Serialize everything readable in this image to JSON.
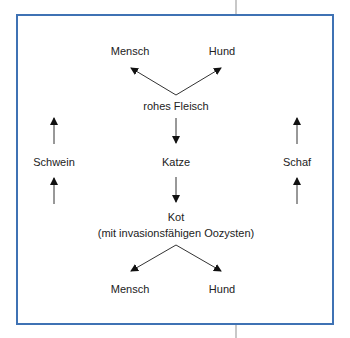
{
  "diagram": {
    "border_color": "#3f72b4",
    "top_row": {
      "left": "Mensch",
      "right": "Hund"
    },
    "source_meat": "rohes Fleisch",
    "middle_row": {
      "left": "Schwein",
      "center": "Katze",
      "right": "Schaf"
    },
    "feces": {
      "line1": "Kot",
      "line2": "(mit invasionsfähigen Oozysten)"
    },
    "bottom_row": {
      "left": "Mensch",
      "right": "Hund"
    }
  }
}
